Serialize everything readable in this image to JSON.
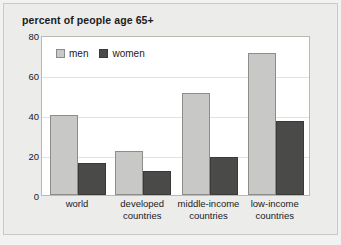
{
  "chart_data": {
    "type": "bar",
    "title": "percent of people age 65+",
    "xlabel": "",
    "ylabel": "",
    "ylim": [
      0,
      80
    ],
    "yticks": [
      "0",
      "20",
      "40",
      "60",
      "80"
    ],
    "grid": true,
    "legend_position": "top-left-inside",
    "categories": [
      "world",
      "developed countries",
      "middle-income countries",
      "low-income countries"
    ],
    "category_lines": [
      [
        "world"
      ],
      [
        "developed",
        "countries"
      ],
      [
        "middle-income",
        "countries"
      ],
      [
        "low-income",
        "countries"
      ]
    ],
    "series": [
      {
        "name": "men",
        "color": "#c8c8c6",
        "values": [
          40,
          22,
          51,
          71
        ]
      },
      {
        "name": "women",
        "color": "#4a4a49",
        "values": [
          16,
          12,
          19,
          37
        ]
      }
    ]
  }
}
